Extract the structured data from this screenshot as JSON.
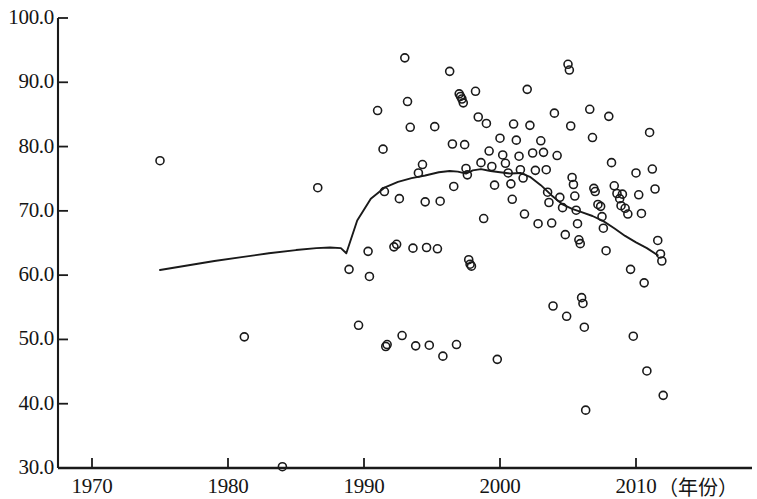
{
  "chart_data": {
    "type": "scatter",
    "title": "",
    "subtitle": "",
    "xlabel": "（年份）",
    "ylabel": "",
    "xlim": [
      1966,
      2013.5
    ],
    "ylim": [
      30.0,
      100.0
    ],
    "grid": false,
    "legend": null,
    "x_ticks": [
      1970,
      1980,
      1990,
      2000,
      2010
    ],
    "x_tick_labels": [
      "1970",
      "1980",
      "1990",
      "2000",
      "2010"
    ],
    "y_ticks": [
      30.0,
      40.0,
      50.0,
      60.0,
      70.0,
      80.0,
      90.0,
      100.0
    ],
    "y_tick_labels": [
      "30.0",
      "40.0",
      "50.0",
      "60.0",
      "70.0",
      "80.0",
      "90.0",
      "100.0"
    ],
    "marker": "open-circle",
    "marker_color": "#1a1a1a",
    "line_color": "#1a1a1a",
    "series": [
      {
        "name": "observations",
        "type": "scatter",
        "points": [
          [
            1975.0,
            77.8
          ],
          [
            1981.2,
            50.4
          ],
          [
            1984.0,
            30.2
          ],
          [
            1986.6,
            73.6
          ],
          [
            1988.9,
            60.9
          ],
          [
            1989.6,
            52.2
          ],
          [
            1990.3,
            63.7
          ],
          [
            1990.4,
            59.8
          ],
          [
            1991.0,
            85.6
          ],
          [
            1991.4,
            79.6
          ],
          [
            1991.5,
            73.0
          ],
          [
            1991.6,
            48.9
          ],
          [
            1991.7,
            49.2
          ],
          [
            1992.2,
            64.4
          ],
          [
            1992.4,
            64.8
          ],
          [
            1992.6,
            71.9
          ],
          [
            1992.8,
            50.6
          ],
          [
            1993.0,
            93.8
          ],
          [
            1993.2,
            87.0
          ],
          [
            1993.4,
            83.0
          ],
          [
            1993.6,
            64.2
          ],
          [
            1993.8,
            49.0
          ],
          [
            1994.0,
            75.9
          ],
          [
            1994.3,
            77.2
          ],
          [
            1994.5,
            71.4
          ],
          [
            1994.6,
            64.3
          ],
          [
            1994.8,
            49.1
          ],
          [
            1995.2,
            83.1
          ],
          [
            1995.4,
            64.1
          ],
          [
            1995.6,
            71.5
          ],
          [
            1995.8,
            47.4
          ],
          [
            1996.3,
            91.7
          ],
          [
            1996.5,
            80.4
          ],
          [
            1996.6,
            73.8
          ],
          [
            1996.8,
            49.2
          ],
          [
            1997.0,
            88.2
          ],
          [
            1997.1,
            87.8
          ],
          [
            1997.2,
            87.4
          ],
          [
            1997.3,
            86.8
          ],
          [
            1997.4,
            80.3
          ],
          [
            1997.5,
            76.6
          ],
          [
            1997.6,
            75.6
          ],
          [
            1997.7,
            62.4
          ],
          [
            1997.8,
            61.7
          ],
          [
            1997.9,
            61.4
          ],
          [
            1998.2,
            88.6
          ],
          [
            1998.4,
            84.6
          ],
          [
            1998.6,
            77.5
          ],
          [
            1998.8,
            68.8
          ],
          [
            1999.0,
            83.6
          ],
          [
            1999.2,
            79.3
          ],
          [
            1999.4,
            76.9
          ],
          [
            1999.6,
            74.0
          ],
          [
            1999.8,
            46.9
          ],
          [
            2000.0,
            81.3
          ],
          [
            2000.2,
            78.7
          ],
          [
            2000.4,
            77.4
          ],
          [
            2000.6,
            75.9
          ],
          [
            2000.8,
            74.2
          ],
          [
            2000.9,
            71.8
          ],
          [
            2001.0,
            83.5
          ],
          [
            2001.2,
            81.0
          ],
          [
            2001.4,
            78.5
          ],
          [
            2001.5,
            76.4
          ],
          [
            2001.7,
            75.1
          ],
          [
            2001.8,
            69.5
          ],
          [
            2002.0,
            88.9
          ],
          [
            2002.2,
            83.3
          ],
          [
            2002.4,
            79.0
          ],
          [
            2002.6,
            76.3
          ],
          [
            2002.8,
            68.0
          ],
          [
            2003.0,
            80.9
          ],
          [
            2003.2,
            79.1
          ],
          [
            2003.4,
            76.4
          ],
          [
            2003.5,
            72.9
          ],
          [
            2003.6,
            71.3
          ],
          [
            2003.8,
            68.1
          ],
          [
            2003.9,
            55.2
          ],
          [
            2004.0,
            85.2
          ],
          [
            2004.2,
            78.6
          ],
          [
            2004.4,
            72.1
          ],
          [
            2004.6,
            70.5
          ],
          [
            2004.8,
            66.3
          ],
          [
            2004.9,
            53.6
          ],
          [
            2005.0,
            92.8
          ],
          [
            2005.1,
            91.9
          ],
          [
            2005.2,
            83.2
          ],
          [
            2005.3,
            75.2
          ],
          [
            2005.4,
            74.1
          ],
          [
            2005.5,
            72.3
          ],
          [
            2005.6,
            70.1
          ],
          [
            2005.7,
            68.0
          ],
          [
            2005.8,
            65.5
          ],
          [
            2005.9,
            64.9
          ],
          [
            2006.0,
            56.5
          ],
          [
            2006.1,
            55.6
          ],
          [
            2006.2,
            51.9
          ],
          [
            2006.3,
            39.0
          ],
          [
            2006.6,
            85.8
          ],
          [
            2006.8,
            81.4
          ],
          [
            2006.9,
            73.5
          ],
          [
            2007.0,
            73.0
          ],
          [
            2007.2,
            71.0
          ],
          [
            2007.4,
            70.7
          ],
          [
            2007.5,
            69.1
          ],
          [
            2007.6,
            67.3
          ],
          [
            2007.8,
            63.8
          ],
          [
            2008.0,
            84.7
          ],
          [
            2008.2,
            77.5
          ],
          [
            2008.4,
            73.9
          ],
          [
            2008.6,
            72.7
          ],
          [
            2008.8,
            71.9
          ],
          [
            2008.9,
            70.8
          ],
          [
            2009.0,
            72.6
          ],
          [
            2009.2,
            70.4
          ],
          [
            2009.4,
            69.5
          ],
          [
            2009.6,
            60.9
          ],
          [
            2009.8,
            50.5
          ],
          [
            2010.0,
            75.9
          ],
          [
            2010.2,
            72.5
          ],
          [
            2010.4,
            69.6
          ],
          [
            2010.6,
            58.8
          ],
          [
            2010.8,
            45.1
          ],
          [
            2011.0,
            82.2
          ],
          [
            2011.2,
            76.5
          ],
          [
            2011.4,
            73.4
          ],
          [
            2011.6,
            65.4
          ],
          [
            2011.8,
            63.3
          ],
          [
            2011.9,
            62.2
          ],
          [
            2012.0,
            41.3
          ]
        ]
      },
      {
        "name": "trend-line",
        "type": "line",
        "points": [
          [
            1975.0,
            60.8
          ],
          [
            1977.0,
            61.5
          ],
          [
            1979.0,
            62.2
          ],
          [
            1981.0,
            62.8
          ],
          [
            1983.0,
            63.4
          ],
          [
            1985.0,
            63.9
          ],
          [
            1986.5,
            64.2
          ],
          [
            1987.5,
            64.3
          ],
          [
            1988.3,
            64.2
          ],
          [
            1988.7,
            63.4
          ],
          [
            1989.5,
            68.5
          ],
          [
            1990.5,
            71.9
          ],
          [
            1991.5,
            73.6
          ],
          [
            1992.5,
            74.5
          ],
          [
            1993.5,
            75.1
          ],
          [
            1994.5,
            75.5
          ],
          [
            1995.5,
            76.0
          ],
          [
            1996.3,
            76.2
          ],
          [
            1996.9,
            76.1
          ],
          [
            1997.5,
            75.8
          ],
          [
            1998.0,
            76.3
          ],
          [
            1998.6,
            76.5
          ],
          [
            1999.3,
            76.2
          ],
          [
            2000.0,
            76.0
          ],
          [
            2000.8,
            75.8
          ],
          [
            2001.5,
            75.9
          ],
          [
            2002.2,
            75.3
          ],
          [
            2003.0,
            74.0
          ],
          [
            2003.8,
            72.4
          ],
          [
            2004.6,
            71.0
          ],
          [
            2005.3,
            70.3
          ],
          [
            2006.0,
            69.8
          ],
          [
            2006.8,
            69.2
          ],
          [
            2007.6,
            68.4
          ],
          [
            2008.4,
            67.3
          ],
          [
            2009.2,
            66.1
          ],
          [
            2010.0,
            65.1
          ],
          [
            2010.8,
            64.2
          ],
          [
            2011.6,
            63.1
          ]
        ]
      }
    ]
  }
}
